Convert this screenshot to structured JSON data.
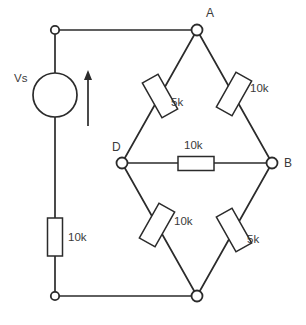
{
  "diagram": {
    "stroke_color": "#2b2b2b",
    "text_color": "#3a3a3a",
    "background_color": "#ffffff",
    "source": {
      "label": "Vs",
      "symbol": "circle",
      "current_arrow": "up"
    },
    "nodes": [
      {
        "id": "A",
        "label": "A",
        "x": 197,
        "y": 30
      },
      {
        "id": "B",
        "label": "B",
        "x": 272,
        "y": 163
      },
      {
        "id": "D",
        "label": "D",
        "x": 122,
        "y": 163
      },
      {
        "id": "C",
        "label": "",
        "x": 197,
        "y": 296
      },
      {
        "id": "TL",
        "label": "",
        "x": 55,
        "y": 30
      },
      {
        "id": "BL",
        "label": "",
        "x": 55,
        "y": 296
      }
    ],
    "resistors": [
      {
        "id": "R-source",
        "label": "10k",
        "between": "TL-BL",
        "orientation": "vertical"
      },
      {
        "id": "R-AD",
        "label": "5k",
        "between": "A-D",
        "orientation": "diagonal"
      },
      {
        "id": "R-AB",
        "label": "10k",
        "between": "A-B",
        "orientation": "diagonal"
      },
      {
        "id": "R-DB",
        "label": "10k",
        "between": "D-B",
        "orientation": "horizontal"
      },
      {
        "id": "R-DC",
        "label": "10k",
        "between": "D-C",
        "orientation": "diagonal"
      },
      {
        "id": "R-BC",
        "label": "5k",
        "between": "B-C",
        "orientation": "diagonal"
      }
    ]
  }
}
